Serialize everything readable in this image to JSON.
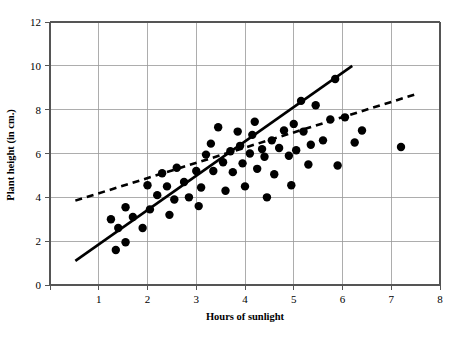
{
  "chart_data": {
    "type": "scatter",
    "title": "",
    "xlabel": "Hours of sunlight",
    "ylabel": "Plant height (in cm.)",
    "xlim": [
      0,
      8
    ],
    "ylim": [
      0,
      12
    ],
    "xticks": [
      0,
      1,
      2,
      3,
      4,
      5,
      6,
      7,
      8
    ],
    "xtick_labels": [
      "0",
      "1",
      "2",
      "3",
      "4",
      "5",
      "6",
      "7",
      "8"
    ],
    "yticks": [
      0,
      2,
      4,
      6,
      8,
      10,
      12
    ],
    "ytick_labels": [
      "0",
      "2",
      "4",
      "6",
      "8",
      "10",
      "12"
    ],
    "grid": true,
    "grid_color": "#999999",
    "legend": "none",
    "marker_color": "#000000",
    "points": [
      [
        1.35,
        1.6
      ],
      [
        1.55,
        1.95
      ],
      [
        1.4,
        2.6
      ],
      [
        1.25,
        3.0
      ],
      [
        1.7,
        3.1
      ],
      [
        1.55,
        3.55
      ],
      [
        1.9,
        2.6
      ],
      [
        2.05,
        3.45
      ],
      [
        2.2,
        4.1
      ],
      [
        2.0,
        4.55
      ],
      [
        2.4,
        4.5
      ],
      [
        2.55,
        3.9
      ],
      [
        2.3,
        5.1
      ],
      [
        2.6,
        5.35
      ],
      [
        2.85,
        4.0
      ],
      [
        2.75,
        4.7
      ],
      [
        3.0,
        5.2
      ],
      [
        3.1,
        4.45
      ],
      [
        3.2,
        5.95
      ],
      [
        3.35,
        5.2
      ],
      [
        3.3,
        6.45
      ],
      [
        3.45,
        7.2
      ],
      [
        3.6,
        4.3
      ],
      [
        3.55,
        5.6
      ],
      [
        3.7,
        6.1
      ],
      [
        3.75,
        5.15
      ],
      [
        3.9,
        6.35
      ],
      [
        3.95,
        5.55
      ],
      [
        4.0,
        4.5
      ],
      [
        4.1,
        6.0
      ],
      [
        4.15,
        6.85
      ],
      [
        4.25,
        5.3
      ],
      [
        4.35,
        6.2
      ],
      [
        4.4,
        5.85
      ],
      [
        4.2,
        7.45
      ],
      [
        4.55,
        6.6
      ],
      [
        4.6,
        5.05
      ],
      [
        4.7,
        6.25
      ],
      [
        4.8,
        7.05
      ],
      [
        4.9,
        5.9
      ],
      [
        4.95,
        4.55
      ],
      [
        5.05,
        6.15
      ],
      [
        5.15,
        8.4
      ],
      [
        5.2,
        7.0
      ],
      [
        5.35,
        6.4
      ],
      [
        5.3,
        5.5
      ],
      [
        5.45,
        8.2
      ],
      [
        5.6,
        6.6
      ],
      [
        5.75,
        7.55
      ],
      [
        5.85,
        9.4
      ],
      [
        5.9,
        5.45
      ],
      [
        6.05,
        7.65
      ],
      [
        6.25,
        6.5
      ],
      [
        6.4,
        7.05
      ],
      [
        7.2,
        6.3
      ],
      [
        3.05,
        3.6
      ],
      [
        2.45,
        3.2
      ],
      [
        4.45,
        4.0
      ],
      [
        5.0,
        7.35
      ],
      [
        3.85,
        7.0
      ]
    ],
    "trend_lines": [
      {
        "name": "solid-regression-line",
        "style": "solid",
        "x0": 0.52,
        "y0": 1.1,
        "x1": 6.2,
        "y1": 10.0
      },
      {
        "name": "dashed-regression-line",
        "style": "dashed",
        "x0": 0.52,
        "y0": 3.85,
        "x1": 7.5,
        "y1": 8.7
      }
    ]
  }
}
